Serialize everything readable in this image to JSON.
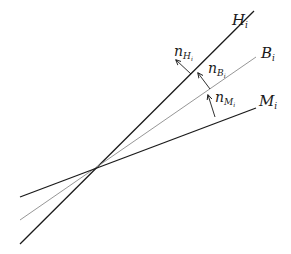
{
  "diagram": {
    "intersection": {
      "x": 96,
      "y": 167
    },
    "lines": [
      {
        "id": "H",
        "label_main": "H",
        "label_sub": "i",
        "x1": 20,
        "y1": 244,
        "x2": 254,
        "y2": 11,
        "color": "#1a1a1a",
        "width": 1.3,
        "label_x": 233,
        "label_y": 25
      },
      {
        "id": "B",
        "label_main": "B",
        "label_sub": "i",
        "x1": 20,
        "y1": 220,
        "x2": 256,
        "y2": 57,
        "color": "#8a8a8a",
        "width": 0.9,
        "label_x": 262,
        "label_y": 57
      },
      {
        "id": "M",
        "label_main": "M",
        "label_sub": "i",
        "x1": 20,
        "y1": 197,
        "x2": 256,
        "y2": 108,
        "color": "#1a1a1a",
        "width": 1.3,
        "label_x": 262,
        "label_y": 105
      }
    ],
    "normals": [
      {
        "id": "nH",
        "label_main": "n",
        "label_sub": "H",
        "label_subsub": "i",
        "x1": 191,
        "y1": 74,
        "x2": 176,
        "y2": 60,
        "label_x": 175,
        "label_y": 57
      },
      {
        "id": "nB",
        "label_main": "n",
        "label_sub": "B",
        "label_subsub": "i",
        "x1": 210,
        "y1": 89,
        "x2": 198,
        "y2": 73,
        "label_x": 209,
        "label_y": 74
      },
      {
        "id": "nM",
        "label_main": "n",
        "label_sub": "M",
        "label_subsub": "i",
        "x1": 215,
        "y1": 117,
        "x2": 208,
        "y2": 95,
        "label_x": 216,
        "label_y": 101
      }
    ]
  },
  "labels": {
    "H": {
      "main": "H",
      "sub": "i"
    },
    "B": {
      "main": "B",
      "sub": "i"
    },
    "M": {
      "main": "M",
      "sub": "i"
    },
    "nH": {
      "main": "n",
      "sub": "H",
      "subsub": "i"
    },
    "nB": {
      "main": "n",
      "sub": "B",
      "subsub": "i"
    },
    "nM": {
      "main": "n",
      "sub": "M",
      "subsub": "i"
    }
  }
}
